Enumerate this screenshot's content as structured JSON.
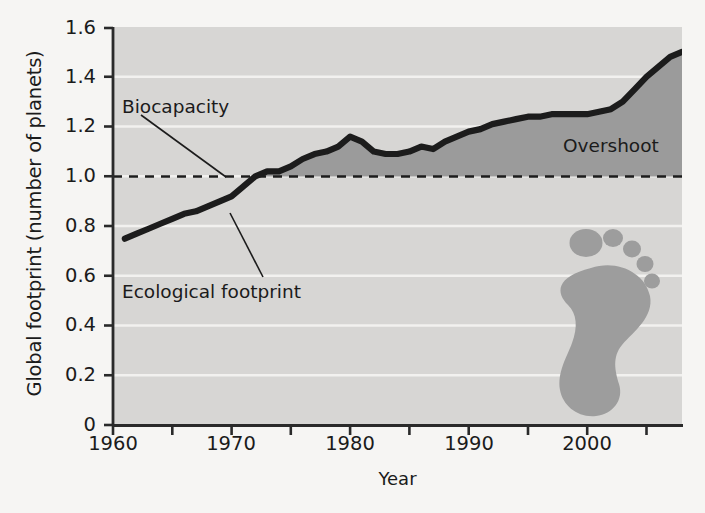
{
  "chart_data": {
    "type": "area",
    "title": "",
    "xlabel": "Year",
    "ylabel": "Global footprint (number of planets)",
    "xlim": [
      1960,
      2008
    ],
    "ylim": [
      0,
      1.6
    ],
    "grid": true,
    "legend_position": "none",
    "xticks_major": [
      1960,
      1970,
      1980,
      1990,
      2000
    ],
    "xtick_labels": [
      "1960",
      "1970",
      "1980",
      "1990",
      "2000"
    ],
    "xticks_minor": [
      1965,
      1975,
      1985,
      1995,
      2005
    ],
    "yticks": [
      0,
      0.2,
      0.4,
      0.6,
      0.8,
      1.0,
      1.2,
      1.4,
      1.6
    ],
    "ytick_labels": [
      "0",
      "0.2",
      "0.4",
      "0.6",
      "0.8",
      "1.0",
      "1.2",
      "1.4",
      "1.6"
    ],
    "series": [
      {
        "name": "Ecological footprint",
        "x": [
          1961,
          1962,
          1963,
          1964,
          1965,
          1966,
          1967,
          1968,
          1969,
          1970,
          1971,
          1972,
          1973,
          1974,
          1975,
          1976,
          1977,
          1978,
          1979,
          1980,
          1981,
          1982,
          1983,
          1984,
          1985,
          1986,
          1987,
          1988,
          1989,
          1990,
          1991,
          1992,
          1993,
          1994,
          1995,
          1996,
          1997,
          1998,
          1999,
          2000,
          2001,
          2002,
          2003,
          2004,
          2005,
          2006,
          2007,
          2008
        ],
        "values": [
          0.75,
          0.77,
          0.79,
          0.81,
          0.83,
          0.85,
          0.86,
          0.88,
          0.9,
          0.92,
          0.96,
          1.0,
          1.02,
          1.02,
          1.04,
          1.07,
          1.09,
          1.1,
          1.12,
          1.16,
          1.14,
          1.1,
          1.09,
          1.09,
          1.1,
          1.12,
          1.11,
          1.14,
          1.16,
          1.18,
          1.19,
          1.21,
          1.22,
          1.23,
          1.24,
          1.24,
          1.25,
          1.25,
          1.25,
          1.25,
          1.26,
          1.27,
          1.3,
          1.35,
          1.4,
          1.44,
          1.48,
          1.5
        ]
      },
      {
        "name": "Biocapacity",
        "constant_value": 1.0,
        "style": "dashed"
      }
    ],
    "annotations": [
      {
        "label": "Biocapacity",
        "points_to_value": 1.0,
        "points_to_year": 1967
      },
      {
        "label": "Ecological footprint",
        "points_to_year": 1967,
        "points_to_value": 0.88
      },
      {
        "label": "Overshoot",
        "region": "above biocapacity line"
      }
    ],
    "colors": {
      "plot_background": "#d7d6d4",
      "overshoot_fill": "#9b9b9b",
      "line": "#1c1c1c",
      "gridline": "#f2f1ef",
      "axis": "#2a2a2a",
      "text": "#1b1b1b",
      "footprint_icon": "#9d9d9d"
    }
  },
  "labels": {
    "ylabel": "Global footprint (number of planets)",
    "xlabel": "Year",
    "biocapacity": "Biocapacity",
    "ecological_footprint": "Ecological footprint",
    "overshoot": "Overshoot",
    "ytick_0": "0",
    "ytick_02": "0.2",
    "ytick_04": "0.4",
    "ytick_06": "0.6",
    "ytick_08": "0.8",
    "ytick_10": "1.0",
    "ytick_12": "1.2",
    "ytick_14": "1.4",
    "ytick_16": "1.6",
    "xtick_1960": "1960",
    "xtick_1970": "1970",
    "xtick_1980": "1980",
    "xtick_1990": "1990",
    "xtick_2000": "2000"
  },
  "icons": {
    "footprint": "footprint-icon"
  }
}
